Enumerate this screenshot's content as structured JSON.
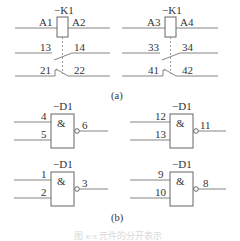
{
  "figure": {
    "part_a": {
      "label": "(a)",
      "relays": [
        {
          "designation": "−K1",
          "coil_left": "A1",
          "coil_right": "A2",
          "no_contact_left": "13",
          "no_contact_right": "14",
          "nc_contact_left": "21",
          "nc_contact_right": "22"
        },
        {
          "designation": "−K1",
          "coil_left": "A3",
          "coil_right": "A4",
          "no_contact_left": "33",
          "no_contact_right": "34",
          "nc_contact_left": "41",
          "nc_contact_right": "42"
        }
      ]
    },
    "part_b": {
      "label": "(b)",
      "gates": [
        {
          "designation": "−D1",
          "symbol": "&",
          "in1": "4",
          "in2": "5",
          "out": "6"
        },
        {
          "designation": "−D1",
          "symbol": "&",
          "in1": "12",
          "in2": "13",
          "out": "11"
        },
        {
          "designation": "−D1",
          "symbol": "&",
          "in1": "1",
          "in2": "2",
          "out": "3"
        },
        {
          "designation": "−D1",
          "symbol": "&",
          "in1": "9",
          "in2": "10",
          "out": "8"
        }
      ]
    },
    "caption": "图 x-x  元件的分开表示"
  }
}
